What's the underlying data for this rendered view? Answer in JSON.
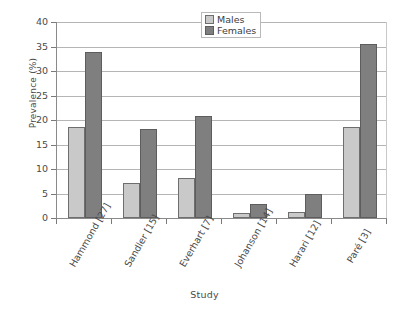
{
  "chart_data": {
    "type": "bar",
    "title": "",
    "xlabel": "Study",
    "ylabel": "Prevalence (%)",
    "ylim": [
      0,
      40
    ],
    "ytick_step": 5,
    "yticks": [
      40,
      35,
      30,
      25,
      20,
      15,
      10,
      5,
      0
    ],
    "grid": "horizontal",
    "legend_position": "top-center",
    "categories": [
      "Hammond [27]",
      "Sandler [15]",
      "Everhart [7]",
      "Johanson [14]",
      "Harari [12]",
      "Paré [3]"
    ],
    "series": [
      {
        "name": "Males",
        "color": "#c9c9c9",
        "values": [
          18.5,
          7.1,
          8.1,
          1.0,
          1.3,
          18.5
        ]
      },
      {
        "name": "Females",
        "color": "#7f7f7f",
        "values": [
          33.8,
          18.2,
          20.8,
          2.9,
          5.0,
          35.5
        ]
      }
    ]
  },
  "legend": {
    "items": [
      {
        "label": "Males",
        "swatch": "males-swatch"
      },
      {
        "label": "Females",
        "swatch": "females-swatch"
      }
    ]
  },
  "axes": {
    "y_title": "Prevalence (%)",
    "x_title": "Study"
  }
}
